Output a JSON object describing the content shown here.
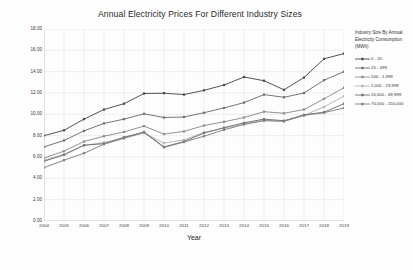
{
  "chart_data": {
    "type": "line",
    "title": "Annual Electricity Prices For Different Industry Sizes",
    "xlabel": "Year",
    "ylabel": "Electricity Price p/kWh",
    "grid": true,
    "legend_position": "right",
    "legend_title": "Industry Size By Annual Electricity Consumption (MWh)",
    "xlim": [
      2004,
      2019
    ],
    "ylim": [
      0,
      18
    ],
    "ytick_step": 2,
    "categories": [
      2004,
      2005,
      2006,
      2007,
      2008,
      2009,
      2010,
      2011,
      2012,
      2013,
      2014,
      2015,
      2016,
      2017,
      2018,
      2019
    ],
    "xtick_labels": [
      "2004",
      "2005",
      "2006",
      "2007",
      "2008",
      "2009",
      "2010",
      "2011",
      "2012",
      "2013",
      "2014",
      "2015",
      "2016",
      "2017",
      "2018",
      "2019"
    ],
    "ytick_labels": [
      "0.00",
      "2.00",
      "4.00",
      "6.00",
      "8.00",
      "10.00",
      "12.00",
      "14.00",
      "16.00",
      "18.00"
    ],
    "series": [
      {
        "name": "0 - 20",
        "color": "#4a4a4a",
        "values": [
          8.0,
          8.5,
          9.55,
          10.45,
          11.0,
          11.95,
          11.98,
          11.85,
          12.25,
          12.75,
          13.5,
          13.15,
          12.3,
          13.45,
          15.2,
          15.7
        ]
      },
      {
        "name": "20 - 499",
        "color": "#6e6e6e",
        "values": [
          6.95,
          7.55,
          8.45,
          9.15,
          9.55,
          10.05,
          9.7,
          9.75,
          10.15,
          10.6,
          11.1,
          11.85,
          11.6,
          12.0,
          13.2,
          14.0
        ]
      },
      {
        "name": "500 - 1,999",
        "color": "#8c8c8c",
        "values": [
          5.9,
          6.55,
          7.45,
          7.95,
          8.35,
          8.9,
          8.15,
          8.4,
          8.95,
          9.3,
          9.7,
          10.25,
          10.1,
          10.45,
          11.45,
          12.5
        ]
      },
      {
        "name": "2,000 - 19,999",
        "color": "#b4b4b4",
        "values": [
          5.7,
          6.25,
          7.1,
          7.35,
          7.8,
          8.25,
          7.3,
          7.6,
          8.3,
          8.7,
          9.1,
          9.45,
          9.35,
          9.9,
          10.7,
          11.7
        ]
      },
      {
        "name": "20,000 - 69,999",
        "color": "#707070",
        "values": [
          5.6,
          6.2,
          7.1,
          7.25,
          7.85,
          8.35,
          6.95,
          7.45,
          8.25,
          8.75,
          9.2,
          9.55,
          9.4,
          9.95,
          10.2,
          11.0
        ]
      },
      {
        "name": "70,000 - 150,000",
        "color": "#808080",
        "values": [
          5.0,
          5.7,
          6.35,
          7.2,
          7.75,
          8.3,
          6.9,
          7.4,
          7.95,
          8.55,
          9.05,
          9.4,
          9.35,
          9.9,
          10.15,
          10.6
        ]
      }
    ]
  }
}
